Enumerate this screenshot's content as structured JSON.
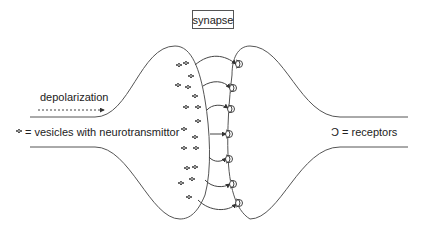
{
  "diagram": {
    "title": "synapse",
    "depolarization_label": "depolarization",
    "vesicle_legend": {
      "symbol": "vesicle-cluster-icon",
      "text": "= vesicles with neurotransmittor"
    },
    "receptor_legend": {
      "symbol": "Ɔ",
      "text": "= receptors"
    },
    "receptor_count": 7,
    "arrow_count": 7,
    "colors": {
      "line": "#555555",
      "text": "#222222",
      "background": "#ffffff"
    }
  }
}
